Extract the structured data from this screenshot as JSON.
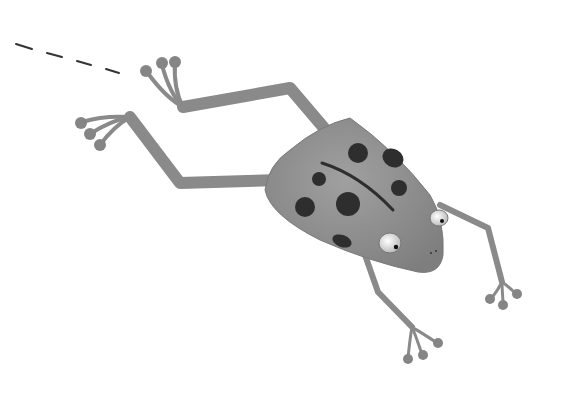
{
  "image": {
    "subject": "Leaping cartoon frog illustration",
    "style": "grayscale",
    "colors": {
      "background": "#ffffff",
      "body": "#8f8f8f",
      "limbs": "#8a8a8a",
      "spots": "#2e2e2e",
      "eye_white": "#eeeeee",
      "pupil": "#111111",
      "motion_dash": "#333333"
    }
  }
}
